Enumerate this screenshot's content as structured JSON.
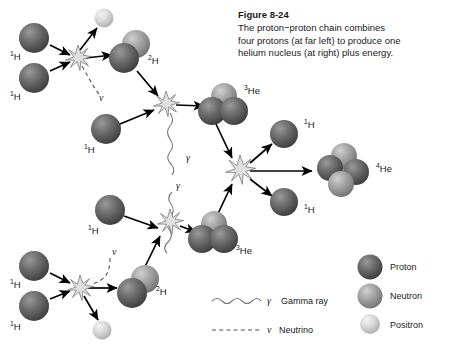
{
  "figure": {
    "number": "Figure 8-24",
    "caption_lines": [
      "The proton−proton chain combines",
      "four protons (at far left) to produce one",
      "helium nucleus (at right) plus energy."
    ]
  },
  "colors": {
    "proton": "#6b6b6b",
    "proton_dark": "#4a4a4a",
    "proton_light": "#8d8d8d",
    "neutron": "#a3a3a3",
    "neutron_dark": "#7e7e7e",
    "neutron_light": "#c4c4c4",
    "positron": "#d2d2d2",
    "positron_dark": "#b4b4b4",
    "positron_light": "#ededed",
    "line": "#000000",
    "burst": "#d8d8d8",
    "text": "#1a1a1a"
  },
  "legend": {
    "particles": [
      {
        "name": "Proton",
        "key": "proton"
      },
      {
        "name": "Neutron",
        "key": "neutron"
      },
      {
        "name": "Positron",
        "key": "positron"
      }
    ],
    "lines": [
      {
        "symbol": "γ",
        "name": "Gamma ray",
        "style": "wavy"
      },
      {
        "symbol": "ν",
        "name": "Neutrino",
        "style": "dashed"
      }
    ]
  },
  "labels": {
    "h1": "1H",
    "h2": "2H",
    "he3": "3He",
    "he4": "4He",
    "gamma": "γ",
    "nu": "ν"
  },
  "nuclei": [
    {
      "id": "h1-a",
      "type": "1H",
      "x": 34,
      "y": 38,
      "label_x": 10,
      "label_y": 56
    },
    {
      "id": "h1-b",
      "type": "1H",
      "x": 34,
      "y": 78,
      "label_x": 10,
      "label_y": 96
    },
    {
      "id": "h2-top",
      "type": "2H",
      "x": 128,
      "y": 52,
      "label_x": 146,
      "label_y": 60
    },
    {
      "id": "pos-top",
      "type": "e+",
      "x": 104,
      "y": 18
    },
    {
      "id": "h1-c",
      "type": "1H",
      "x": 106,
      "y": 129,
      "label_x": 84,
      "label_y": 150
    },
    {
      "id": "he3-top",
      "type": "3He",
      "x": 222,
      "y": 106,
      "label_x": 240,
      "label_y": 94
    },
    {
      "id": "h1-d",
      "type": "1H",
      "x": 34,
      "y": 266,
      "label_x": 10,
      "label_y": 284
    },
    {
      "id": "h1-e",
      "type": "1H",
      "x": 34,
      "y": 306,
      "label_x": 10,
      "label_y": 326
    },
    {
      "id": "h2-bot",
      "type": "2H",
      "x": 135,
      "y": 288,
      "label_x": 152,
      "label_y": 292
    },
    {
      "id": "pos-bot",
      "type": "e+",
      "x": 102,
      "y": 330
    },
    {
      "id": "h1-f",
      "type": "1H",
      "x": 110,
      "y": 210,
      "label_x": 88,
      "label_y": 230
    },
    {
      "id": "he3-bot",
      "type": "3He",
      "x": 212,
      "y": 234,
      "label_x": 232,
      "label_y": 250
    },
    {
      "id": "h1-g",
      "type": "1H",
      "x": 284,
      "y": 134,
      "label_x": 302,
      "label_y": 126
    },
    {
      "id": "h1-h",
      "type": "1H",
      "x": 284,
      "y": 202,
      "label_x": 302,
      "label_y": 208
    },
    {
      "id": "he4",
      "type": "4He",
      "x": 340,
      "y": 172,
      "label_x": 374,
      "label_y": 170
    }
  ],
  "bursts": [
    {
      "id": "burst-1",
      "x": 78,
      "y": 58
    },
    {
      "id": "burst-2",
      "x": 166,
      "y": 104
    },
    {
      "id": "burst-3",
      "x": 240,
      "y": 170
    },
    {
      "id": "burst-4",
      "x": 170,
      "y": 222
    },
    {
      "id": "burst-5",
      "x": 80,
      "y": 288
    }
  ],
  "emissions": [
    {
      "id": "gamma-upper",
      "symbol": "γ",
      "x": 186,
      "y": 158
    },
    {
      "id": "gamma-lower",
      "symbol": "γ",
      "x": 178,
      "y": 186
    },
    {
      "id": "nu-upper",
      "symbol": "ν",
      "x": 100,
      "y": 98
    },
    {
      "id": "nu-lower",
      "symbol": "ν",
      "x": 110,
      "y": 252
    }
  ]
}
